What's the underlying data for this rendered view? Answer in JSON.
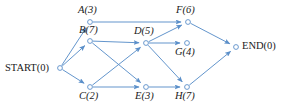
{
  "diagram": {
    "type": "directed-graph",
    "background_color": "#ffffff",
    "edge_color": "#5b8fc9",
    "node_stroke_color": "#5b8fc9",
    "node_fill_color": "#ffffff",
    "label_color": "#1a1a1a",
    "nodes": [
      {
        "id": "START",
        "label": "START(0)",
        "name": "START",
        "duration": "0",
        "x": 60,
        "y": 68,
        "label_x": 5,
        "label_y": 63,
        "style": "terminal",
        "anchor": "right-of-node-left"
      },
      {
        "id": "A",
        "label": "A(3)",
        "name": "A",
        "duration": "3",
        "x": 90,
        "y": 22,
        "label_x": 78,
        "label_y": 5,
        "style": "italic"
      },
      {
        "id": "B",
        "label": "B(7)",
        "name": "B",
        "duration": "7",
        "x": 90,
        "y": 41,
        "label_x": 79,
        "label_y": 25,
        "style": "italic"
      },
      {
        "id": "C",
        "label": "C(2)",
        "name": "C",
        "duration": "2",
        "x": 90,
        "y": 87,
        "label_x": 79,
        "label_y": 91,
        "style": "italic"
      },
      {
        "id": "D",
        "label": "D(5)",
        "name": "D",
        "duration": "5",
        "x": 146,
        "y": 43,
        "label_x": 134,
        "label_y": 26,
        "style": "italic"
      },
      {
        "id": "E",
        "label": "E(3)",
        "name": "E",
        "duration": "3",
        "x": 146,
        "y": 87,
        "label_x": 135,
        "label_y": 91,
        "style": "italic"
      },
      {
        "id": "F",
        "label": "F(6)",
        "name": "F",
        "duration": "6",
        "x": 188,
        "y": 22,
        "label_x": 176,
        "label_y": 5,
        "style": "italic"
      },
      {
        "id": "G",
        "label": "G(4)",
        "name": "G",
        "duration": "4",
        "x": 187,
        "y": 43,
        "label_x": 175,
        "label_y": 47,
        "style": "italic"
      },
      {
        "id": "H",
        "label": "H(7)",
        "name": "H",
        "duration": "7",
        "x": 187,
        "y": 87,
        "label_x": 175,
        "label_y": 91,
        "style": "italic"
      },
      {
        "id": "END",
        "label": "END(0)",
        "name": "END",
        "duration": "0",
        "x": 236,
        "y": 47,
        "label_x": 242,
        "label_y": 41,
        "style": "terminal"
      }
    ],
    "edges": [
      {
        "from": "START",
        "to": "A",
        "name": "edge-start-a"
      },
      {
        "from": "START",
        "to": "B",
        "name": "edge-start-b"
      },
      {
        "from": "START",
        "to": "C",
        "name": "edge-start-c"
      },
      {
        "from": "A",
        "to": "F",
        "name": "edge-a-f"
      },
      {
        "from": "B",
        "to": "D",
        "name": "edge-b-d"
      },
      {
        "from": "B",
        "to": "E",
        "name": "edge-b-e"
      },
      {
        "from": "C",
        "to": "D",
        "name": "edge-c-d"
      },
      {
        "from": "C",
        "to": "E",
        "name": "edge-c-e"
      },
      {
        "from": "D",
        "to": "F",
        "name": "edge-d-f"
      },
      {
        "from": "D",
        "to": "G",
        "name": "edge-d-g"
      },
      {
        "from": "D",
        "to": "H",
        "name": "edge-d-h"
      },
      {
        "from": "E",
        "to": "H",
        "name": "edge-e-h"
      },
      {
        "from": "F",
        "to": "END",
        "name": "edge-f-end"
      },
      {
        "from": "H",
        "to": "END",
        "name": "edge-h-end"
      }
    ]
  }
}
